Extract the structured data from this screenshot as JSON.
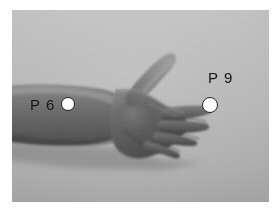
{
  "figure": {
    "kind": "grayscale-photograph",
    "plate_background_color": "#b9b9b9",
    "page_background_color": "#ffffff"
  },
  "markers": [
    {
      "id": "p6",
      "label": "P 6",
      "code": "P6",
      "dot_color": "#ffffff",
      "dot_outline_color": "#2a2a2a",
      "label_color": "#121212",
      "location": "inner forearm, proximal to wrist crease",
      "label_position": "left"
    },
    {
      "id": "p9",
      "label": "P 9",
      "code": "P9",
      "dot_color": "#ffffff",
      "dot_outline_color": "#2a2a2a",
      "label_color": "#121212",
      "location": "tip of the middle finger",
      "label_position": "above-right"
    }
  ],
  "subject": {
    "skin_tone_mid": "#6b6b6b",
    "skin_tone_shadow": "#4c4c4c",
    "skin_tone_highlight": "#8d8d8d",
    "palm_tone": "#5c5c5c"
  }
}
